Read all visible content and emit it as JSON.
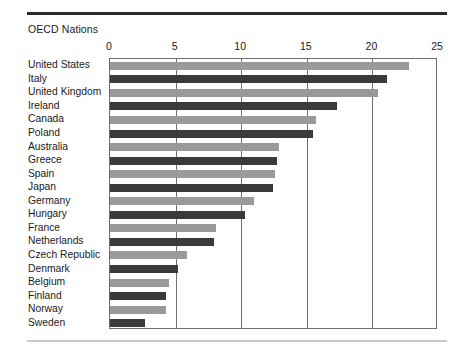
{
  "chart_data": {
    "type": "bar",
    "orientation": "horizontal",
    "title": "OECD Nations",
    "xlabel": "",
    "ylabel": "",
    "xlim": [
      0,
      25
    ],
    "xticks": [
      0,
      5,
      10,
      15,
      20,
      25
    ],
    "grid": true,
    "legend": "none",
    "categories": [
      "United States",
      "Italy",
      "United Kingdom",
      "Ireland",
      "Canada",
      "Poland",
      "Australia",
      "Greece",
      "Spain",
      "Japan",
      "Germany",
      "Hungary",
      "France",
      "Netherlands",
      "Czech Republic",
      "Denmark",
      "Belgium",
      "Finland",
      "Norway",
      "Sweden"
    ],
    "values": [
      22.8,
      21.1,
      20.4,
      17.3,
      15.7,
      15.5,
      12.9,
      12.7,
      12.6,
      12.4,
      11.0,
      10.3,
      8.1,
      7.9,
      5.9,
      5.2,
      4.5,
      4.3,
      4.3,
      2.7
    ],
    "bar_colors": [
      "#9a9a9a",
      "#3a3a3a",
      "#9a9a9a",
      "#3a3a3a",
      "#9a9a9a",
      "#3a3a3a",
      "#9a9a9a",
      "#3a3a3a",
      "#9a9a9a",
      "#3a3a3a",
      "#9a9a9a",
      "#3a3a3a",
      "#9a9a9a",
      "#3a3a3a",
      "#9a9a9a",
      "#3a3a3a",
      "#9a9a9a",
      "#3a3a3a",
      "#9a9a9a",
      "#3a3a3a"
    ]
  },
  "style": {
    "axis_color": "#6e6e6e",
    "rule_top_color": "#2b2b2b",
    "rule_bottom_color": "#c9c9c9",
    "text_color": "#1a1a1a",
    "background": "#ffffff"
  }
}
